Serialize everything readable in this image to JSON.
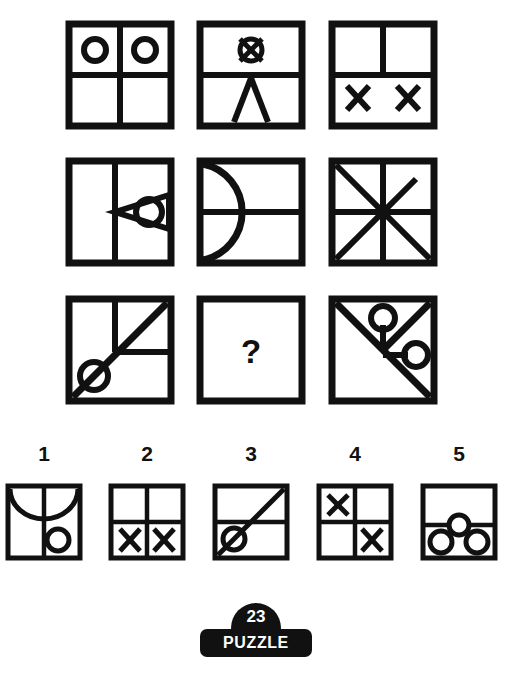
{
  "puzzle": {
    "number": "23",
    "label": "PUZZLE",
    "missing_marker": "?",
    "stroke_color": "#111111",
    "background_color": "#ffffff",
    "type": "matrix-reasoning",
    "grid_rows": 3,
    "grid_cols": 3
  },
  "matrix": {
    "cells": [
      {
        "id": "cell-r1c1",
        "row": 1,
        "col": 1,
        "description": "Square divided into four quadrants; circle in top-left quadrant and circle in top-right quadrant",
        "elements": [
          "square-border",
          "vertical-midline",
          "horizontal-midline",
          "circle-top-left",
          "circle-top-right"
        ]
      },
      {
        "id": "cell-r1c2",
        "row": 1,
        "col": 2,
        "description": "Square with horizontal midline; circle crossed by an X in the top half; triangular peak (two converging lines) in the bottom half",
        "elements": [
          "square-border",
          "horizontal-midline",
          "circle-with-x",
          "triangle-peak"
        ]
      },
      {
        "id": "cell-r1c3",
        "row": 1,
        "col": 3,
        "description": "Square with horizontal midline and a vertical line in the top half only; two X marks in the bottom half",
        "elements": [
          "square-border",
          "horizontal-midline",
          "vertical-upper-half",
          "x-bottom-left",
          "x-bottom-right"
        ]
      },
      {
        "id": "cell-r2c1",
        "row": 2,
        "col": 1,
        "description": "Square with vertical midline; left-pointing triangle with a circle inside it occupying the right panel",
        "elements": [
          "square-border",
          "vertical-midline",
          "left-pointing-triangle",
          "circle-in-triangle"
        ]
      },
      {
        "id": "cell-r2c2",
        "row": 2,
        "col": 2,
        "description": "Square with horizontal midline and a large semicircular arc bulging right from the left edge",
        "elements": [
          "square-border",
          "horizontal-midline",
          "semicircle-arc"
        ]
      },
      {
        "id": "cell-r2c3",
        "row": 2,
        "col": 3,
        "description": "Square with both diagonals plus horizontal and vertical midlines forming an eight-spoke asterisk",
        "elements": [
          "square-border",
          "vertical-midline",
          "horizontal-midline",
          "diagonal-tl-br",
          "diagonal-bl-tr"
        ]
      },
      {
        "id": "cell-r3c1",
        "row": 3,
        "col": 1,
        "description": "Diagonal from bottom-left to top-right with a circle on its lower portion; vertical line in upper-left; horizontal line on the right",
        "elements": [
          "square-border",
          "diagonal-bl-tr",
          "circle-on-diagonal",
          "vertical-upper-left",
          "horizontal-right"
        ]
      },
      {
        "id": "cell-r3c2",
        "row": 3,
        "col": 2,
        "description": "Empty square containing a question mark, the missing element",
        "elements": [
          "square-border",
          "question-mark"
        ],
        "is_missing": true
      },
      {
        "id": "cell-r3c3",
        "row": 3,
        "col": 3,
        "description": "Anti-diagonal from top-left to bottom-right plus a line to the top-right corner, with two stemmed circles from the junction",
        "elements": [
          "square-border",
          "diagonal-tl-br",
          "diagonal-center-tr",
          "stem-up-circle",
          "stem-right-circle"
        ]
      }
    ]
  },
  "options": {
    "items": [
      {
        "number": "1",
        "id": "option-1",
        "description": "Square with full vertical midline, a downward-bulging arc across the top, and a circle in the lower-right area",
        "elements": [
          "square-border",
          "vertical-midline",
          "arc-down",
          "circle-lower-right"
        ]
      },
      {
        "number": "2",
        "id": "option-2",
        "description": "Square divided into four quadrants with an X in the bottom-left and an X in the bottom-right",
        "elements": [
          "square-border",
          "vertical-midline",
          "horizontal-midline",
          "x-bottom-left",
          "x-bottom-right"
        ]
      },
      {
        "number": "3",
        "id": "option-3",
        "description": "Square with horizontal midline and a diagonal from bottom-left to top-right with a circle on the lower part of the diagonal",
        "elements": [
          "square-border",
          "horizontal-midline",
          "diagonal-bl-tr",
          "circle-on-diagonal"
        ]
      },
      {
        "number": "4",
        "id": "option-4",
        "description": "Square divided into four quadrants with an X in the top-left and an X in the bottom-right",
        "elements": [
          "square-border",
          "vertical-midline",
          "horizontal-midline",
          "x-top-left",
          "x-bottom-right"
        ]
      },
      {
        "number": "5",
        "id": "option-5",
        "description": "Square with horizontal midline, one circle straddling the midline at center and two circles below it",
        "elements": [
          "square-border",
          "horizontal-midline",
          "circle-center",
          "circle-bottom-left",
          "circle-bottom-right"
        ]
      }
    ]
  }
}
